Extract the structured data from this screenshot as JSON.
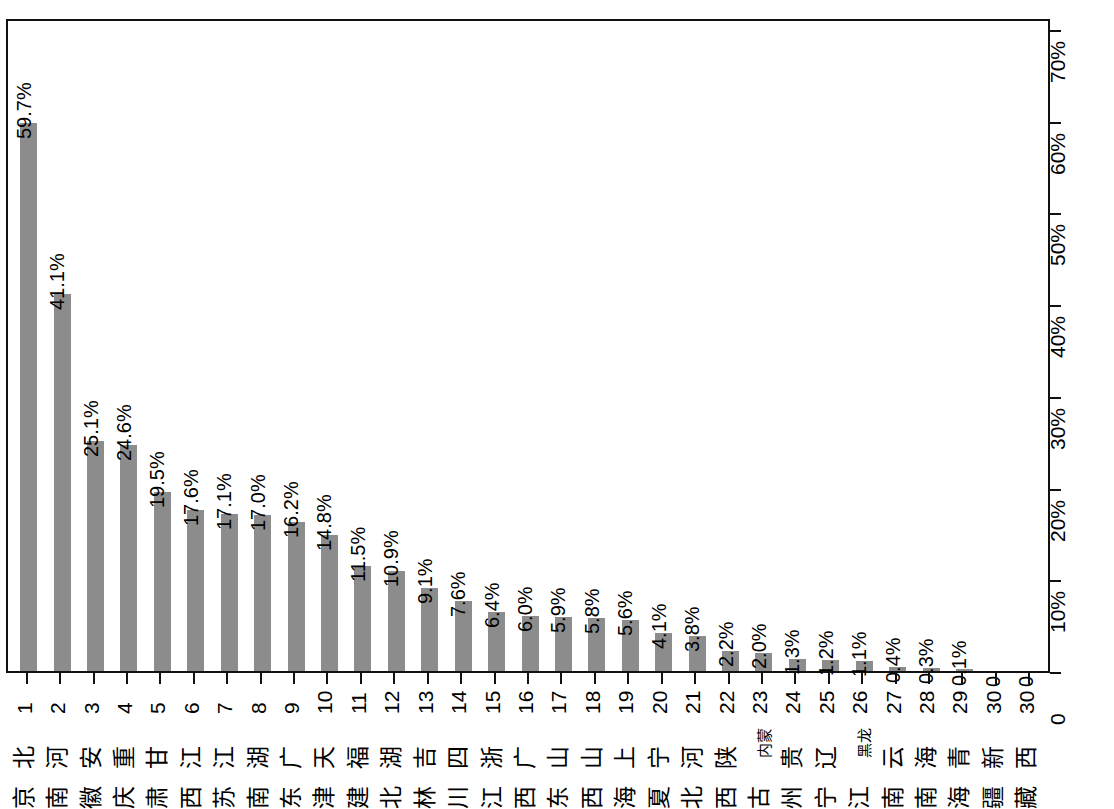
{
  "chart_data": {
    "type": "bar",
    "orientation": "rotated-90-ccw",
    "title": "",
    "subtitle": "",
    "xlabel": "",
    "ylabel": "",
    "ylim": [
      0,
      70
    ],
    "grid": false,
    "legend": null,
    "axis_ticks": [
      "0",
      "10%",
      "20%",
      "30%",
      "40%",
      "50%",
      "60%",
      "70%"
    ],
    "axis_tick_values": [
      0,
      10,
      20,
      30,
      40,
      50,
      60,
      70
    ],
    "bar_color": "#8c8c8c",
    "frame_color": "#111111",
    "ranks": [
      "1",
      "2",
      "3",
      "4",
      "5",
      "6",
      "7",
      "8",
      "9",
      "10",
      "11",
      "12",
      "13",
      "14",
      "15",
      "16",
      "17",
      "18",
      "19",
      "20",
      "21",
      "22",
      "23",
      "24",
      "25",
      "26",
      "27",
      "28",
      "29",
      "30",
      "30"
    ],
    "categories": [
      "北京",
      "河南",
      "安徽",
      "重庆",
      "甘肃",
      "江西",
      "江苏",
      "湖南",
      "广东",
      "天津",
      "福建",
      "湖北",
      "吉林",
      "四川",
      "浙江",
      "广西",
      "山东",
      "山西",
      "上海",
      "宁夏",
      "河北",
      "陕西",
      "内蒙古",
      "贵州",
      "辽宁",
      "黑龙江",
      "云南",
      "海南",
      "青海",
      "新疆",
      "西藏"
    ],
    "category_chars": [
      [
        "北",
        "京"
      ],
      [
        "河",
        "南"
      ],
      [
        "安",
        "徽"
      ],
      [
        "重",
        "庆"
      ],
      [
        "甘",
        "肃"
      ],
      [
        "江",
        "西"
      ],
      [
        "江",
        "苏"
      ],
      [
        "湖",
        "南"
      ],
      [
        "广",
        "东"
      ],
      [
        "天",
        "津"
      ],
      [
        "福",
        "建"
      ],
      [
        "湖",
        "北"
      ],
      [
        "吉",
        "林"
      ],
      [
        "四",
        "川"
      ],
      [
        "浙",
        "江"
      ],
      [
        "广",
        "西"
      ],
      [
        "山",
        "东"
      ],
      [
        "山",
        "西"
      ],
      [
        "上",
        "海"
      ],
      [
        "宁",
        "夏"
      ],
      [
        "河",
        "北"
      ],
      [
        "陕",
        "西"
      ],
      [
        "内蒙",
        "古"
      ],
      [
        "贵",
        "州"
      ],
      [
        "辽",
        "宁"
      ],
      [
        "黑龙",
        "江"
      ],
      [
        "云",
        "南"
      ],
      [
        "海",
        "南"
      ],
      [
        "青",
        "海"
      ],
      [
        "新",
        "疆"
      ],
      [
        "西",
        "藏"
      ]
    ],
    "values": [
      59.7,
      41.1,
      25.1,
      24.6,
      19.5,
      17.6,
      17.1,
      17.0,
      16.2,
      14.8,
      11.5,
      10.9,
      9.1,
      7.6,
      6.4,
      6.0,
      5.9,
      5.8,
      5.6,
      4.1,
      3.8,
      2.2,
      2.0,
      1.3,
      1.2,
      1.1,
      0.4,
      0.3,
      0.1,
      0,
      0
    ],
    "value_labels": [
      "59.7%",
      "41.1%",
      "25.1%",
      "24.6%",
      "19.5%",
      "17.6%",
      "17.1%",
      "17.0%",
      "16.2%",
      "14.8%",
      "11.5%",
      "10.9%",
      "9.1%",
      "7.6%",
      "6.4%",
      "6.0%",
      "5.9%",
      "5.8%",
      "5.6%",
      "4.1%",
      "3.8%",
      "2.2%",
      "2.0%",
      "1.3%",
      "1.2%",
      "1.1%",
      "0.4%",
      "0.3%",
      "0.1%",
      "0",
      "0"
    ]
  }
}
